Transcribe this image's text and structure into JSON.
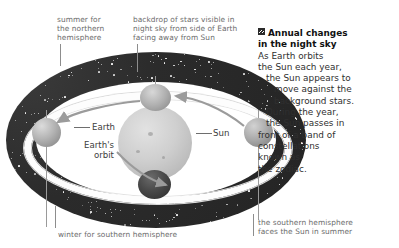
{
  "diagram": {
    "name": "earth-orbit-zodiac-diagram",
    "labels": {
      "summer_northern": "summer for\nthe northern\nhemisphere",
      "backdrop_stars": "backdrop of stars visible in\nnight sky from side of Earth\nfacing away from Sun",
      "winter_southern": "winter for southern hemisphere",
      "southern_summer": "the southern hemisphere\nfaces the Sun in summer",
      "earth": "Earth",
      "earth_orbit": "Earth's\norbit",
      "sun": "Sun"
    },
    "objects": {
      "sun_name": "sun-sphere",
      "earth_positions": [
        "earth-left",
        "earth-top",
        "earth-right",
        "earth-bottom"
      ],
      "orbit_name": "elliptical-orbit-band",
      "starfield_name": "starry-torus-backdrop"
    },
    "colors": {
      "starfield": "#272727",
      "orbit_band": "#fdfdfd",
      "sun": "#cfcfcf",
      "label_text": "#6b6b6b",
      "caption_text": "#2f2f2f",
      "leader_line": "#8d8d8d"
    }
  },
  "caption": {
    "marker": "«",
    "heading_line1": "Annual changes",
    "heading_line2": "in the night sky",
    "body_lines": [
      "As Earth orbits",
      "the Sun each year,",
      "the Sun appears to",
      "move against the",
      "background stars.",
      "During the year,",
      "the Sun passes in",
      "front of a band of",
      "constellations",
      "known as",
      "the zodiac."
    ]
  }
}
